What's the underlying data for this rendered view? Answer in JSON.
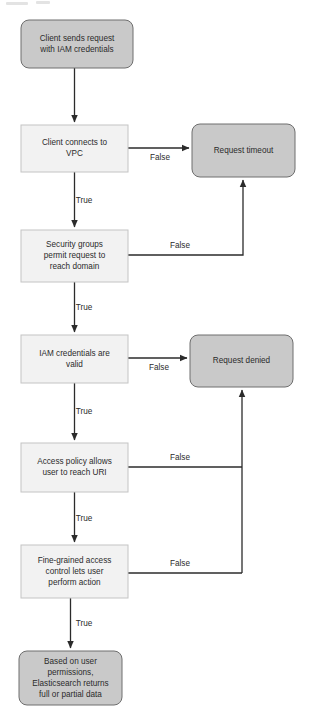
{
  "diagram": {
    "canvas": {
      "width": 312,
      "height": 728,
      "background": "#ffffff"
    },
    "colors": {
      "decision_fill": "#f2f2f2",
      "decision_stroke": "#c4c4c4",
      "terminal_fill": "#c9c9c9",
      "terminal_stroke": "#6e6e6e",
      "text": "#2b2b2b",
      "edge": "#2b2b2b"
    },
    "nodes": [
      {
        "id": "start",
        "shape": "rounded",
        "kind": "terminal",
        "x": 21,
        "y": 20,
        "w": 112,
        "h": 48,
        "rx": 8,
        "lines": [
          "Client sends request",
          "with IAM credentials"
        ]
      },
      {
        "id": "vpc",
        "shape": "rect",
        "kind": "decision",
        "x": 21,
        "y": 125,
        "w": 107,
        "h": 47,
        "rx": 0,
        "lines": [
          "Client connects to",
          "VPC"
        ]
      },
      {
        "id": "timeout",
        "shape": "rounded",
        "kind": "terminal",
        "x": 192,
        "y": 124,
        "w": 103,
        "h": 53,
        "rx": 8,
        "lines": [
          "Request timeout"
        ]
      },
      {
        "id": "security-groups",
        "shape": "rect",
        "kind": "decision",
        "x": 21,
        "y": 230,
        "w": 107,
        "h": 52,
        "rx": 0,
        "lines": [
          "Security groups",
          "permit request to",
          "reach domain"
        ]
      },
      {
        "id": "iam-valid",
        "shape": "rect",
        "kind": "decision",
        "x": 21,
        "y": 335,
        "w": 107,
        "h": 48,
        "rx": 0,
        "lines": [
          "IAM credentials are",
          "valid"
        ]
      },
      {
        "id": "denied",
        "shape": "rounded",
        "kind": "terminal",
        "x": 190,
        "y": 335,
        "w": 103,
        "h": 52,
        "rx": 8,
        "lines": [
          "Request denied"
        ]
      },
      {
        "id": "access-policy",
        "shape": "rect",
        "kind": "decision",
        "x": 21,
        "y": 443,
        "w": 107,
        "h": 49,
        "rx": 0,
        "lines": [
          "Access policy allows",
          "user to reach URI"
        ]
      },
      {
        "id": "fine-grained",
        "shape": "rect",
        "kind": "decision",
        "x": 21,
        "y": 545,
        "w": 107,
        "h": 53,
        "rx": 0,
        "lines": [
          "Fine-grained access",
          "control lets user",
          "perform action"
        ]
      },
      {
        "id": "result",
        "shape": "rounded",
        "kind": "terminal",
        "x": 19,
        "y": 651,
        "w": 103,
        "h": 54,
        "rx": 8,
        "lines": [
          "Based on user",
          "permissions,",
          "Elasticsearch returns",
          "full or partial data"
        ]
      }
    ],
    "edges": [
      {
        "id": "start-to-vpc",
        "from": "start",
        "to": "vpc",
        "label": "",
        "path": "M 74.5 68 L 74.5 122",
        "arrow": true
      },
      {
        "id": "vpc-false-timeout",
        "from": "vpc",
        "to": "timeout",
        "label": "False",
        "label_x": 160,
        "label_y": 158,
        "path": "M 128 148 L 189 148",
        "arrow": true
      },
      {
        "id": "vpc-true-security",
        "from": "vpc",
        "to": "security-groups",
        "label": "True",
        "label_x": 84,
        "label_y": 201,
        "path": "M 74.5 172 L 74.5 227",
        "arrow": true
      },
      {
        "id": "security-false-timeout",
        "from": "security-groups",
        "to": "timeout",
        "label": "False",
        "label_x": 180,
        "label_y": 246,
        "path": "M 128 255 L 243 255 L 243 180",
        "arrow": true
      },
      {
        "id": "security-true-iam",
        "from": "security-groups",
        "to": "iam-valid",
        "label": "True",
        "label_x": 84,
        "label_y": 308,
        "path": "M 74.5 282 L 74.5 332",
        "arrow": true
      },
      {
        "id": "iam-false-denied",
        "from": "iam-valid",
        "to": "denied",
        "label": "False",
        "label_x": 159,
        "label_y": 368,
        "path": "M 128 358 L 187 358",
        "arrow": true
      },
      {
        "id": "iam-true-policy",
        "from": "iam-valid",
        "to": "access-policy",
        "label": "True",
        "label_x": 84,
        "label_y": 412,
        "path": "M 74.5 383 L 74.5 440",
        "arrow": true
      },
      {
        "id": "policy-false-denied",
        "from": "access-policy",
        "to": "denied",
        "label": "False",
        "label_x": 180,
        "label_y": 458,
        "path": "M 128 467 L 242 467",
        "arrow": false
      },
      {
        "id": "denied-riser",
        "from": "fine-grained",
        "to": "denied",
        "label": "",
        "path": "M 242 573 L 242 390",
        "arrow": true
      },
      {
        "id": "policy-true-fine",
        "from": "access-policy",
        "to": "fine-grained",
        "label": "True",
        "label_x": 84,
        "label_y": 519,
        "path": "M 74.5 492 L 74.5 542",
        "arrow": true
      },
      {
        "id": "fine-false-denied",
        "from": "fine-grained",
        "to": "denied",
        "label": "False",
        "label_x": 180,
        "label_y": 564,
        "path": "M 128 573 L 242 573",
        "arrow": false
      },
      {
        "id": "fine-true-result",
        "from": "fine-grained",
        "to": "result",
        "label": "True",
        "label_x": 84,
        "label_y": 624,
        "path": "M 70.5 598 L 70.5 648",
        "arrow": true
      }
    ]
  }
}
